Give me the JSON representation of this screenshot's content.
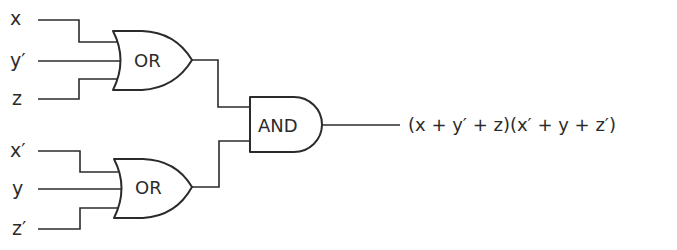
{
  "diagram": {
    "type": "logic-circuit",
    "top_or_gate": {
      "label": "OR",
      "inputs": [
        "x",
        "y′",
        "z"
      ]
    },
    "bottom_or_gate": {
      "label": "OR",
      "inputs": [
        "x′",
        "y",
        "z′"
      ]
    },
    "and_gate": {
      "label": "AND"
    },
    "output_expression": "(x + y′ + z)(x′ + y + z′)"
  },
  "colors": {
    "stroke": "#2b2b2b",
    "background": "#ffffff"
  }
}
